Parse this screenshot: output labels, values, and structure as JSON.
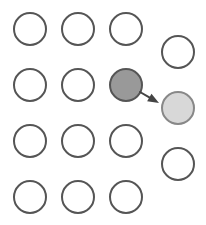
{
  "canvas": {
    "width": 206,
    "height": 225,
    "background": "#ffffff"
  },
  "style": {
    "outline_stroke": "#555555",
    "outline_fill": "#ffffff",
    "source_fill": "#999999",
    "source_stroke": "#555555",
    "target_fill": "#d8d8d8",
    "target_stroke": "#888888",
    "arrow_color": "#444444",
    "stroke_width": 2,
    "radius": 16
  },
  "grid": {
    "name": "main-grid",
    "rows": 4,
    "columns": 3,
    "radius": 16,
    "circles": [
      {
        "id": "grid-r1c1",
        "cx": 30,
        "cy": 29,
        "state": "empty"
      },
      {
        "id": "grid-r1c2",
        "cx": 78,
        "cy": 29,
        "state": "empty"
      },
      {
        "id": "grid-r1c3",
        "cx": 126,
        "cy": 29,
        "state": "empty"
      },
      {
        "id": "grid-r2c1",
        "cx": 30,
        "cy": 85,
        "state": "empty"
      },
      {
        "id": "grid-r2c2",
        "cx": 78,
        "cy": 85,
        "state": "empty"
      },
      {
        "id": "grid-r2c3",
        "cx": 126,
        "cy": 85,
        "state": "source"
      },
      {
        "id": "grid-r3c1",
        "cx": 30,
        "cy": 141,
        "state": "empty"
      },
      {
        "id": "grid-r3c2",
        "cx": 78,
        "cy": 141,
        "state": "empty"
      },
      {
        "id": "grid-r3c3",
        "cx": 126,
        "cy": 141,
        "state": "empty"
      },
      {
        "id": "grid-r4c1",
        "cx": 30,
        "cy": 197,
        "state": "empty"
      },
      {
        "id": "grid-r4c2",
        "cx": 78,
        "cy": 197,
        "state": "empty"
      },
      {
        "id": "grid-r4c3",
        "cx": 126,
        "cy": 197,
        "state": "empty"
      }
    ]
  },
  "side_column": {
    "name": "side-column",
    "count": 3,
    "radius": 16,
    "circles": [
      {
        "id": "side-1",
        "cx": 178,
        "cy": 52,
        "state": "empty"
      },
      {
        "id": "side-2",
        "cx": 178,
        "cy": 108,
        "state": "target"
      },
      {
        "id": "side-3",
        "cx": 178,
        "cy": 164,
        "state": "empty"
      }
    ]
  },
  "arrow": {
    "name": "transfer-arrow",
    "from": {
      "x": 140,
      "cy_ref": "grid-r2c3",
      "y": 92
    },
    "to": {
      "x": 159,
      "cy_ref": "side-2",
      "y": 103
    },
    "head_size": 7
  }
}
